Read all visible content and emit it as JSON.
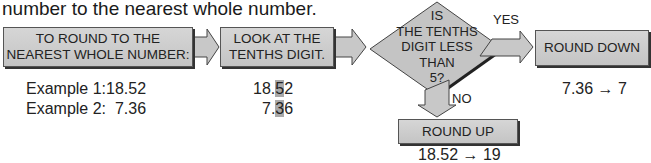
{
  "intro_text": "number to the nearest whole number.",
  "steps": {
    "start": "TO ROUND TO THE\nNEAREST WHOLE NUMBER:",
    "start_l1": "TO ROUND TO THE",
    "start_l2": "NEAREST WHOLE NUMBER:",
    "look_l1": "LOOK AT THE",
    "look_l2": "TENTHS DIGIT.",
    "decision": [
      "IS",
      "THE TENTHS",
      "DIGIT LESS",
      "THAN",
      "5?"
    ],
    "yes_label": "YES",
    "no_label": "NO",
    "round_down": "ROUND DOWN",
    "round_up": "ROUND UP"
  },
  "examples": {
    "ex1_label": "Example 1:",
    "ex1_value": "18.52",
    "ex2_label": "Example 2:",
    "ex2_value": "7.36",
    "ex1_pre": "18.",
    "ex1_digit": "5",
    "ex1_post": "2",
    "ex2_pre": "7.",
    "ex2_digit": "3",
    "ex2_post": "6",
    "down_result": "7.36 → 7",
    "up_result": "18.52 → 19"
  },
  "colors": {
    "box_fill": "#cccccc",
    "highlight": "#a9a9a9",
    "outline": "#555555"
  }
}
